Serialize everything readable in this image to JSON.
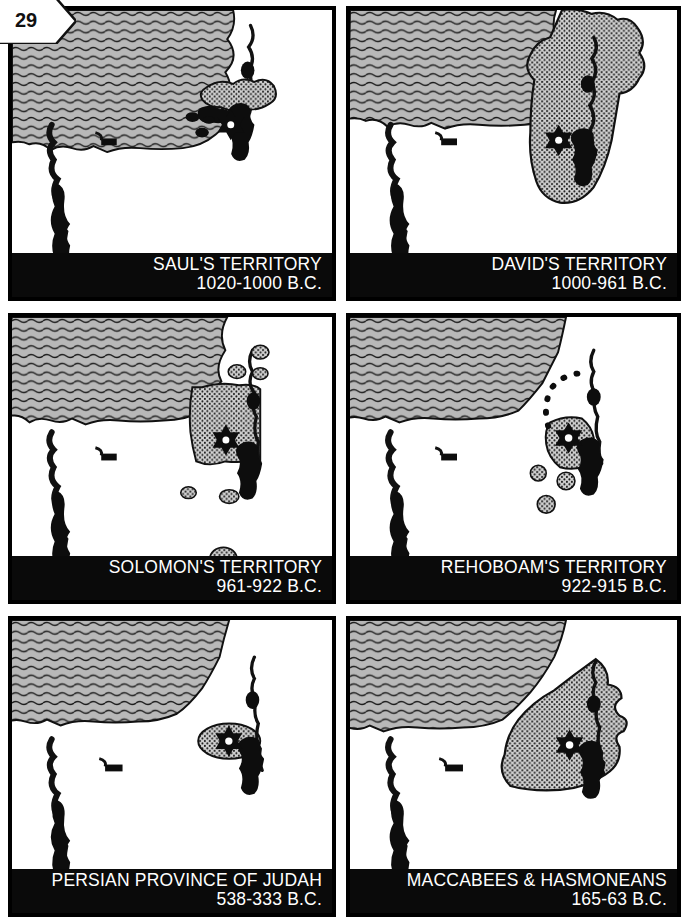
{
  "page": {
    "number": "29"
  },
  "panels": [
    {
      "id": "sauls-territory",
      "title": "SAUL'S TERRITORY",
      "dates": "1020-1000 B.C."
    },
    {
      "id": "davids-territory",
      "title": "DAVID'S TERRITORY",
      "dates": "1000-961 B.C."
    },
    {
      "id": "solomons-territory",
      "title": "SOLOMON'S TERRITORY",
      "dates": "961-922 B.C."
    },
    {
      "id": "rehoboams-territory",
      "title": "REHOBOAM'S TERRITORY",
      "dates": "922-915 B.C."
    },
    {
      "id": "persian-province",
      "title": "PERSIAN PROVINCE OF JUDAH",
      "dates": "538-333 B.C."
    },
    {
      "id": "maccabees",
      "title": "MACCABEES & HASMONEANS",
      "dates": "165-63 B.C."
    }
  ],
  "map_features": {
    "sea_label": "Mediterranean Sea",
    "river_label": "Jordan River",
    "dead_sea_label": "Dead Sea",
    "nile_label": "Nile River",
    "capital_marker": "Jerusalem",
    "territory_fill": "stippled",
    "sea_fill": "wavy-lines"
  },
  "colors": {
    "sea": "#b4b4b4",
    "territory": "#c8c8c8",
    "ink": "#000000",
    "land": "#ffffff",
    "caption_bg": "#0a0a0a",
    "caption_text": "#ffffff"
  }
}
